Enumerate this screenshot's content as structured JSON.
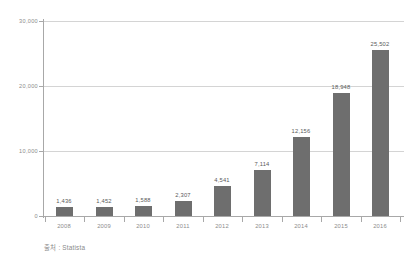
{
  "chart_data": {
    "type": "bar",
    "title": "",
    "subtitle": "",
    "xlabel": "",
    "ylabel": "",
    "categories": [
      "2008",
      "2009",
      "2010",
      "2011",
      "2012",
      "2013",
      "2014",
      "2015",
      "2016"
    ],
    "values": [
      1436,
      1452,
      1588,
      2307,
      4541,
      7114,
      12156,
      18948,
      25502
    ],
    "value_labels": [
      "1,436",
      "1,452",
      "1,588",
      "2,307",
      "4,541",
      "7,114",
      "12,156",
      "18,948",
      "25,502"
    ],
    "ylim": [
      0,
      30000
    ],
    "yticks": [
      0,
      10000,
      20000,
      30000
    ],
    "ytick_labels": [
      "0",
      "10,000",
      "20,000",
      "30,000"
    ],
    "grid": true,
    "legend": false,
    "legend_position": "none",
    "series": [
      {
        "name": "",
        "values": [
          1436,
          1452,
          1588,
          2307,
          4541,
          7114,
          12156,
          18948,
          25502
        ]
      }
    ],
    "bar_color": "#6e6e6e",
    "grid_color": "#d4d4d4",
    "axis_color": "#a8a8a8",
    "background": "#ffffff"
  },
  "annotations": {
    "source": "출처 : Statista"
  }
}
